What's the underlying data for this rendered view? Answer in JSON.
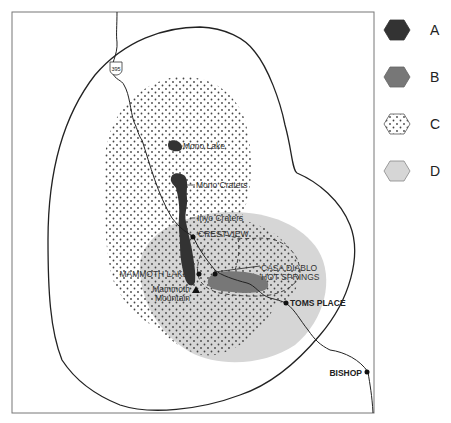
{
  "map": {
    "highway_shield": "395",
    "places": {
      "mono_lake": "Mono Lake",
      "mono_craters": "Mono Craters",
      "inyo_craters": "Inyo Craters",
      "crestview": "CRESTVIEW",
      "mammoth_lakes": "MAMMOTH LAKES",
      "mammoth_mountain_1": "Mammoth",
      "mammoth_mountain_2": "Mountain",
      "casa_diablo_1": "CASA DIABLO",
      "casa_diablo_2": "HOT SPRINGS",
      "toms_place": "TOMS PLACE",
      "bishop": "BISHOP"
    }
  },
  "legend": {
    "items": [
      {
        "key": "A",
        "label": "A",
        "fill": "#333333",
        "pattern": "solid"
      },
      {
        "key": "B",
        "label": "B",
        "fill": "#777777",
        "pattern": "solid"
      },
      {
        "key": "C",
        "label": "C",
        "fill": "#ffffff",
        "pattern": "dots"
      },
      {
        "key": "D",
        "label": "D",
        "fill": "#d6d6d6",
        "pattern": "solid"
      }
    ]
  },
  "colors": {
    "zone_a": "#333333",
    "zone_b": "#777777",
    "zone_d": "#d6d6d6",
    "frame": "#777777",
    "line": "#222222"
  }
}
